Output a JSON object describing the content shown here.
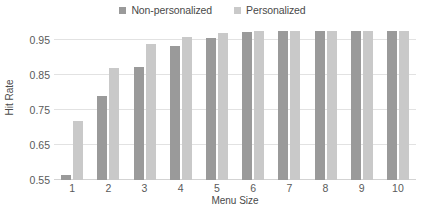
{
  "chart_data": {
    "type": "bar",
    "title": "",
    "xlabel": "Menu Size",
    "ylabel": "Hit Rate",
    "categories": [
      "1",
      "2",
      "3",
      "4",
      "5",
      "6",
      "7",
      "8",
      "9",
      "10"
    ],
    "series": [
      {
        "name": "Non-personalized",
        "color": "#9a9a9a",
        "values": [
          0.565,
          0.79,
          0.873,
          0.933,
          0.957,
          0.973,
          0.975,
          0.976,
          0.977,
          0.977
        ]
      },
      {
        "name": "Personalized",
        "color": "#c9c9c9",
        "values": [
          0.72,
          0.871,
          0.94,
          0.958,
          0.969,
          0.975,
          0.976,
          0.977,
          0.977,
          0.977
        ]
      }
    ],
    "ylim": [
      0.55,
      0.99
    ],
    "yticks": [
      "0.55",
      "0.65",
      "0.75",
      "0.85",
      "0.95"
    ],
    "ytick_values": [
      0.55,
      0.65,
      0.75,
      0.85,
      0.95
    ],
    "grid": true,
    "legend_position": "top-center"
  },
  "legend": {
    "entries": [
      {
        "label": "Non-personalized",
        "color": "#9a9a9a"
      },
      {
        "label": "Personalized",
        "color": "#c9c9c9"
      }
    ]
  }
}
